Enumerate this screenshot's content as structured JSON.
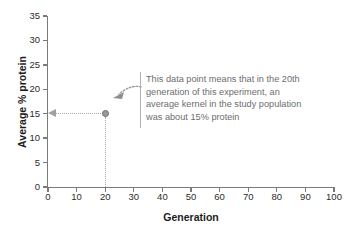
{
  "chart_data": {
    "type": "scatter",
    "title": "",
    "xlabel": "Generation",
    "ylabel": "Average % protein",
    "xlim": [
      0,
      100
    ],
    "ylim": [
      0,
      35
    ],
    "x_ticks": [
      0,
      10,
      20,
      30,
      40,
      50,
      60,
      70,
      80,
      90,
      100
    ],
    "y_ticks": [
      0,
      5,
      10,
      15,
      20,
      25,
      30,
      35
    ],
    "grid": false,
    "legend": "none",
    "series": [
      {
        "name": "average kernel protein",
        "points": [
          {
            "x": 20,
            "y": 15
          }
        ]
      }
    ],
    "annotations": [
      {
        "target": {
          "x": 20,
          "y": 15
        },
        "lines": [
          "This data point means that in the 20th",
          "generation of this experiment, an",
          "average kernel in the study population",
          "was about 15% protein"
        ]
      }
    ],
    "guides": [
      {
        "type": "horizontal-dotted-arrow",
        "from_x": 20,
        "to_x": 0,
        "y": 15
      },
      {
        "type": "vertical-dotted",
        "x": 20,
        "from_y": 15,
        "to_y": 0
      }
    ]
  },
  "colors": {
    "axis": "#7a7a7a",
    "tick_label": "#2b2b2b",
    "axis_title": "#1c1c1c",
    "annotation_text": "#6d6d6d",
    "guide_line": "#a8a8a8",
    "data_point_fill": "#9a9a9a",
    "data_point_stroke": "#6e6e6e",
    "callout_bar": "#b4b4b4",
    "background": "#ffffff"
  }
}
